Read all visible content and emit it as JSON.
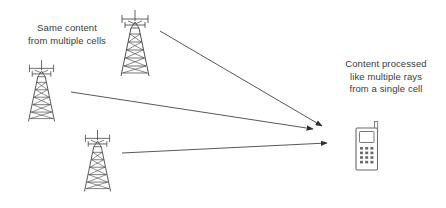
{
  "diagram": {
    "background_color": "#ffffff",
    "stroke_color": "#3a3a3a",
    "text_color": "#3a3a3a",
    "width": 446,
    "height": 208,
    "labels": {
      "left": "Same content\nfrom multiple cells",
      "right": "Content processed\nlike multiple rays\nfrom a single cell"
    },
    "nodes": {
      "tower_top": {
        "name": "cell-tower-top",
        "x": 134,
        "y": 12,
        "scale": 1.0
      },
      "tower_left": {
        "name": "cell-tower-left",
        "x": 44,
        "y": 62,
        "scale": 0.92
      },
      "tower_bottom": {
        "name": "cell-tower-bottom",
        "x": 100,
        "y": 135,
        "scale": 0.92
      },
      "handset": {
        "name": "mobile-handset",
        "x": 356,
        "y": 127,
        "width": 22,
        "height": 44
      }
    },
    "arrows": [
      {
        "name": "ray-from-top-tower",
        "x1": 160,
        "y1": 31,
        "x2": 322,
        "y2": 127
      },
      {
        "name": "ray-from-left-tower",
        "x1": 71,
        "y1": 92,
        "x2": 316,
        "y2": 130
      },
      {
        "name": "ray-from-bottom-tower",
        "x1": 122,
        "y1": 153,
        "x2": 330,
        "y2": 143
      }
    ]
  }
}
